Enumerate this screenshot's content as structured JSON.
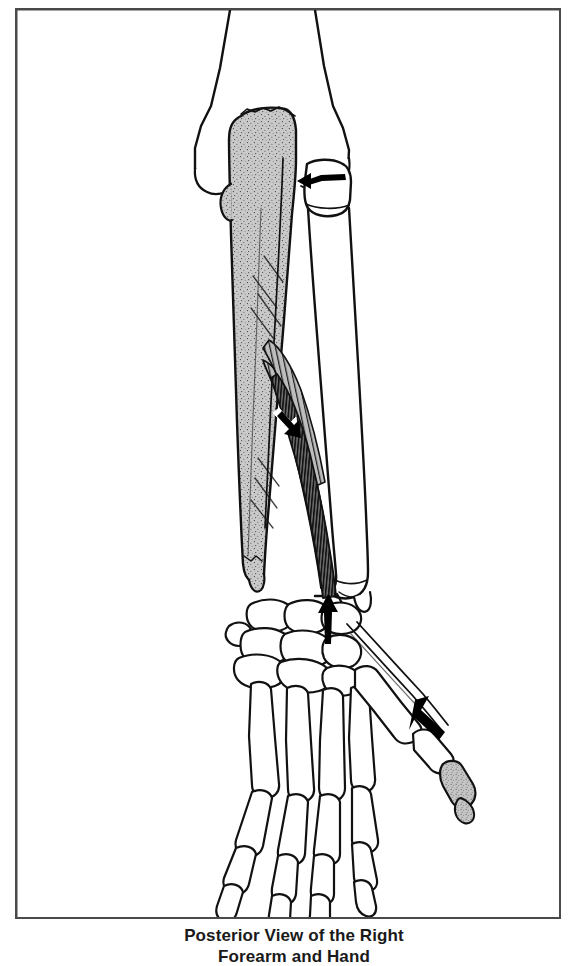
{
  "figure": {
    "caption": "Posterior View of the Right\nForearm and Hand",
    "caption_visible_line": "Posterior View of the Right",
    "alt_description": "Line drawing of the posterior view of the right forearm and hand skeleton showing the extensor pollicis longus muscle arising from the shaded ulna and inserting on the shaded distal phalanx of the thumb",
    "border_color": "#4a4a4a",
    "background_color": "#ffffff",
    "ink_color": "#111111",
    "shaded_bone_fill": "#c8c8c8",
    "muscle_fill": "#9a9a9a",
    "arrow_color": "#000000"
  },
  "anatomy": {
    "bones": [
      {
        "name": "humerus",
        "shading": "outline"
      },
      {
        "name": "ulna",
        "shading": "gray-stippled"
      },
      {
        "name": "radius",
        "shading": "outline"
      },
      {
        "name": "carpals",
        "shading": "outline"
      },
      {
        "name": "metacarpals",
        "shading": "outline"
      },
      {
        "name": "phalanges",
        "shading": "outline"
      },
      {
        "name": "thumb-distal-phalanx",
        "shading": "gray-stippled"
      }
    ],
    "muscle": {
      "name": "extensor-pollicis-longus",
      "origin": "ulna",
      "insertion": "thumb-distal-phalanx",
      "shading": "dense-hatched"
    },
    "pointers": [
      {
        "name": "radial-neck-arrow",
        "direction": "left"
      },
      {
        "name": "muscle-belly-arrow",
        "direction": "down-right"
      },
      {
        "name": "wrist-tendon-arrow",
        "direction": "up"
      },
      {
        "name": "thumb-insertion-arrow",
        "direction": "down-right"
      }
    ]
  }
}
